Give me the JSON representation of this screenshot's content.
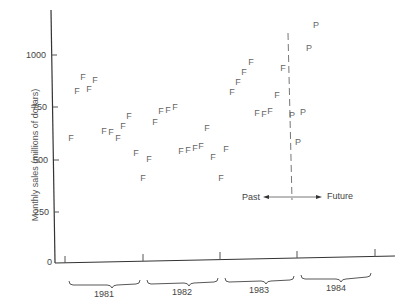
{
  "chart_data": {
    "type": "scatter",
    "title": "",
    "xlabel": "",
    "ylabel": "Monthly sales (millions of dollars)",
    "ylim": [
      0,
      1150
    ],
    "yticks": [
      0,
      250,
      500,
      750,
      1000
    ],
    "ytick_labels": [
      "0",
      "250",
      "500",
      "750",
      "1000"
    ],
    "grid": false,
    "x_groups": [
      "1981",
      "1982",
      "1983",
      "1984"
    ],
    "divider": {
      "label_left": "Past",
      "label_right": "Future",
      "style": "dashed",
      "position": "end of 1983"
    },
    "series": [
      {
        "name": "F",
        "marker": "F",
        "description": "Actual monthly sales (past)",
        "points": [
          {
            "x": 71,
            "value": 600
          },
          {
            "x": 77,
            "value": 825
          },
          {
            "x": 83,
            "value": 893
          },
          {
            "x": 89,
            "value": 836
          },
          {
            "x": 95,
            "value": 882
          },
          {
            "x": 104,
            "value": 635
          },
          {
            "x": 111,
            "value": 630
          },
          {
            "x": 118,
            "value": 600
          },
          {
            "x": 123,
            "value": 661
          },
          {
            "x": 129,
            "value": 708
          },
          {
            "x": 136,
            "value": 527
          },
          {
            "x": 143,
            "value": 410
          },
          {
            "x": 149,
            "value": 500
          },
          {
            "x": 155,
            "value": 680
          },
          {
            "x": 161,
            "value": 731
          },
          {
            "x": 168,
            "value": 736
          },
          {
            "x": 175,
            "value": 750
          },
          {
            "x": 181,
            "value": 540
          },
          {
            "x": 188,
            "value": 543
          },
          {
            "x": 195,
            "value": 553
          },
          {
            "x": 201,
            "value": 563
          },
          {
            "x": 207,
            "value": 650
          },
          {
            "x": 213,
            "value": 510
          },
          {
            "x": 221,
            "value": 410
          },
          {
            "x": 226,
            "value": 548
          },
          {
            "x": 232,
            "value": 822
          },
          {
            "x": 238,
            "value": 870
          },
          {
            "x": 244,
            "value": 918
          },
          {
            "x": 251,
            "value": 966
          },
          {
            "x": 257,
            "value": 721
          },
          {
            "x": 264,
            "value": 716
          },
          {
            "x": 270,
            "value": 731
          },
          {
            "x": 277,
            "value": 808
          },
          {
            "x": 283,
            "value": 938
          }
        ]
      },
      {
        "name": "P",
        "marker": "P",
        "description": "Projected monthly sales (future)",
        "points": [
          {
            "x": 292,
            "value": 712
          },
          {
            "x": 298,
            "value": 580
          },
          {
            "x": 303,
            "value": 726
          },
          {
            "x": 309,
            "value": 1034
          },
          {
            "x": 316,
            "value": 1144
          }
        ]
      }
    ]
  }
}
